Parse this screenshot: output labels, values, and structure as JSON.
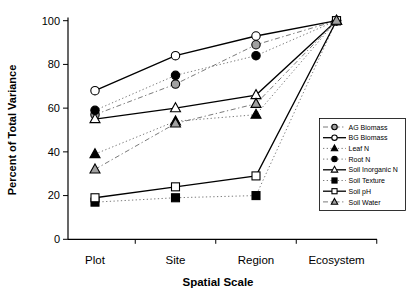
{
  "chart_data": {
    "type": "line",
    "title": "",
    "xlabel": "Spatial Scale",
    "ylabel": "Percent of Total Variance",
    "categories": [
      "Plot",
      "Site",
      "Region",
      "Ecosystem"
    ],
    "ylim": [
      0,
      100
    ],
    "yticks": [
      0,
      20,
      40,
      60,
      80,
      100
    ],
    "grid": false,
    "legend_position": "right",
    "colors": {
      "black": "#000000",
      "gray": "#a0a0a0",
      "white": "#ffffff",
      "axis": "#000000"
    },
    "series": [
      {
        "name": "AG Biomass",
        "marker": "circle",
        "fill": "gray",
        "line": "dashdot",
        "values": [
          57,
          71,
          89,
          100
        ]
      },
      {
        "name": "BG Biomass",
        "marker": "circle",
        "fill": "white",
        "line": "solid",
        "values": [
          68,
          84,
          93,
          100
        ]
      },
      {
        "name": "Leaf N",
        "marker": "triangle",
        "fill": "black",
        "line": "dotted",
        "values": [
          39,
          54,
          57,
          100
        ]
      },
      {
        "name": "Root N",
        "marker": "circle",
        "fill": "black",
        "line": "dotted",
        "values": [
          59,
          75,
          84,
          100
        ]
      },
      {
        "name": "Soil Inorganic N",
        "marker": "triangle",
        "fill": "white",
        "line": "solid",
        "values": [
          55,
          60,
          66,
          100
        ]
      },
      {
        "name": "Soil Texture",
        "marker": "square",
        "fill": "black",
        "line": "dotted",
        "values": [
          17,
          19,
          20,
          100
        ]
      },
      {
        "name": "Soil pH",
        "marker": "square",
        "fill": "white",
        "line": "solid",
        "values": [
          19,
          24,
          29,
          100
        ]
      },
      {
        "name": "Soil Water",
        "marker": "triangle",
        "fill": "gray",
        "line": "dashdot",
        "values": [
          32,
          53,
          62,
          100
        ]
      }
    ]
  }
}
